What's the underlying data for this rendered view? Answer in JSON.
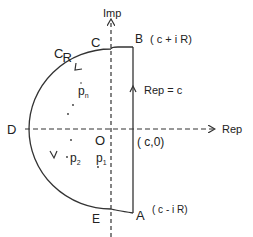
{
  "diagram": {
    "axes": {
      "imag_label": "Imp",
      "real_label": "Rep"
    },
    "points": {
      "B": {
        "name": "B",
        "coord": "( c + i R)"
      },
      "A": {
        "name": "A",
        "coord": "( c - i R)"
      },
      "C": {
        "name": "C"
      },
      "D": {
        "name": "D"
      },
      "E": {
        "name": "E"
      },
      "O": {
        "name": "O"
      },
      "c0": {
        "coord": "( c,0)"
      }
    },
    "contour_label_main": "C",
    "contour_label_sub": "R",
    "line_label": "Rep = c",
    "poles": {
      "pn_main": "p",
      "pn_sub": "n",
      "p2_main": "p",
      "p2_sub": "2",
      "p1_main": "p",
      "p1_sub": "1"
    },
    "colors": {
      "line": "#333333",
      "text": "#222222",
      "background": "#ffffff"
    }
  }
}
